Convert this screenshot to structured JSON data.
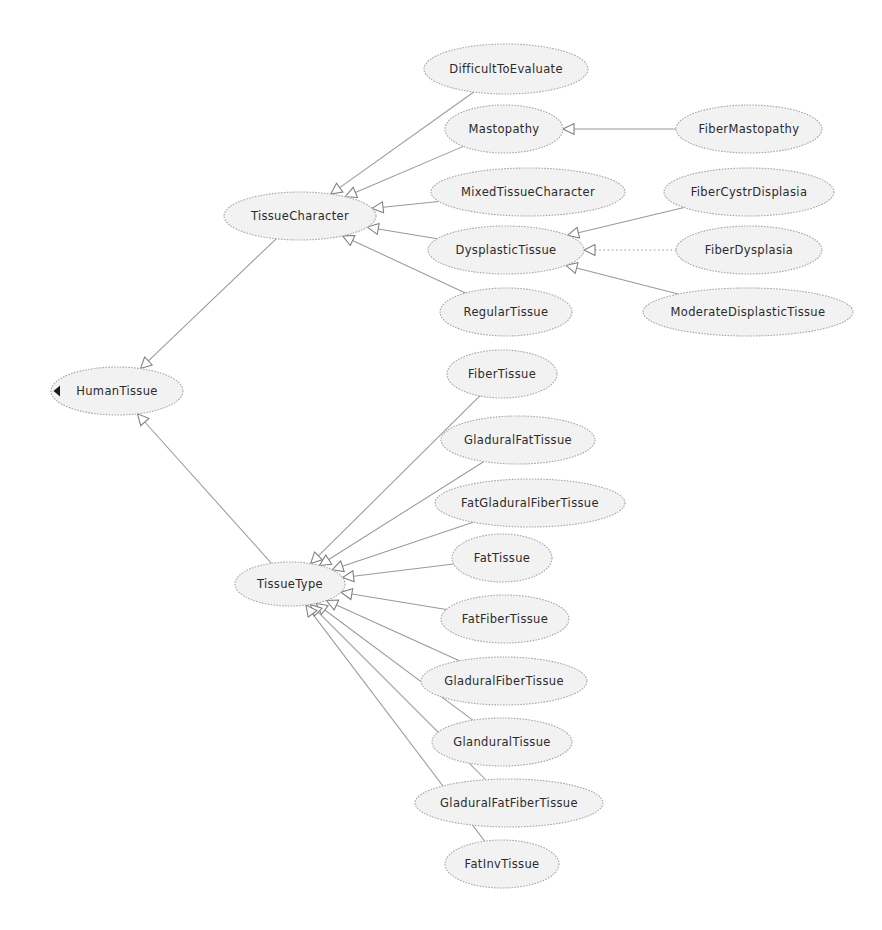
{
  "diagram": {
    "type": "uml-generalization-graph",
    "canvas": {
      "width": 882,
      "height": 930,
      "background": "#ffffff"
    },
    "style": {
      "node_fill": "#f2f2f2",
      "node_stroke": "#a8a8a8",
      "edge_stroke": "#9a9a9a",
      "label_color": "#2b2b2b",
      "root_marker_color": "#1a1a1a"
    },
    "nodes": [
      {
        "id": "DifficultToEvaluate",
        "label": "DifficultToEvaluate",
        "cx": 506,
        "cy": 69,
        "rx": 82,
        "ry": 25
      },
      {
        "id": "Mastopathy",
        "label": "Mastopathy",
        "cx": 504,
        "cy": 129,
        "rx": 59,
        "ry": 24
      },
      {
        "id": "FiberMastopathy",
        "label": "FiberMastopathy",
        "cx": 749,
        "cy": 129,
        "rx": 73,
        "ry": 24
      },
      {
        "id": "MixedTissueCharacter",
        "label": "MixedTissueCharacter",
        "cx": 528,
        "cy": 192,
        "rx": 97,
        "ry": 24
      },
      {
        "id": "FiberCystrDisplasia",
        "label": "FiberCystrDisplasia",
        "cx": 749,
        "cy": 192,
        "rx": 85,
        "ry": 24
      },
      {
        "id": "TissueCharacter",
        "label": "TissueCharacter",
        "cx": 300,
        "cy": 216,
        "rx": 76,
        "ry": 24
      },
      {
        "id": "DysplasticTissue",
        "label": "DysplasticTissue",
        "cx": 506,
        "cy": 250,
        "rx": 78,
        "ry": 24
      },
      {
        "id": "FiberDysplasia",
        "label": "FiberDysplasia",
        "cx": 749,
        "cy": 250,
        "rx": 73,
        "ry": 24
      },
      {
        "id": "RegularTissue",
        "label": "RegularTissue",
        "cx": 506,
        "cy": 312,
        "rx": 66,
        "ry": 24
      },
      {
        "id": "ModerateDisplasticTissue",
        "label": "ModerateDisplasticTissue",
        "cx": 748,
        "cy": 312,
        "rx": 105,
        "ry": 24
      },
      {
        "id": "HumanTissue",
        "label": "HumanTissue",
        "cx": 117,
        "cy": 391,
        "rx": 66,
        "ry": 24
      },
      {
        "id": "FiberTissue",
        "label": "FiberTissue",
        "cx": 502,
        "cy": 374,
        "rx": 55,
        "ry": 24
      },
      {
        "id": "GladuralFatTissue",
        "label": "GladuralFatTissue",
        "cx": 518,
        "cy": 440,
        "rx": 77,
        "ry": 24
      },
      {
        "id": "FatGladuralFiberTissue",
        "label": "FatGladuralFiberTissue",
        "cx": 530,
        "cy": 503,
        "rx": 95,
        "ry": 24
      },
      {
        "id": "FatTissue",
        "label": "FatTissue",
        "cx": 502,
        "cy": 558,
        "rx": 50,
        "ry": 24
      },
      {
        "id": "FatFiberTissue",
        "label": "FatFiberTissue",
        "cx": 505,
        "cy": 619,
        "rx": 64,
        "ry": 24
      },
      {
        "id": "GladuralFiberTissue",
        "label": "GladuralFiberTissue",
        "cx": 504,
        "cy": 681,
        "rx": 83,
        "ry": 24
      },
      {
        "id": "GlanduralTissue",
        "label": "GlanduralTissue",
        "cx": 502,
        "cy": 742,
        "rx": 70,
        "ry": 24
      },
      {
        "id": "GladuralFatFiberTissue",
        "label": "GladuralFatFiberTissue",
        "cx": 509,
        "cy": 803,
        "rx": 94,
        "ry": 24
      },
      {
        "id": "FatInvTissue",
        "label": "FatInvTissue",
        "cx": 502,
        "cy": 864,
        "rx": 57,
        "ry": 24
      }
    ],
    "edges": [
      {
        "from": "TissueCharacter",
        "to": "HumanTissue",
        "style": "solid",
        "arrow": "hollow-triangle"
      },
      {
        "from": "TissueType",
        "to": "HumanTissue",
        "style": "solid",
        "arrow": "hollow-triangle"
      },
      {
        "from": "DifficultToEvaluate",
        "to": "TissueCharacter",
        "style": "solid",
        "arrow": "hollow-triangle"
      },
      {
        "from": "Mastopathy",
        "to": "TissueCharacter",
        "style": "solid",
        "arrow": "hollow-triangle"
      },
      {
        "from": "MixedTissueCharacter",
        "to": "TissueCharacter",
        "style": "solid",
        "arrow": "hollow-triangle"
      },
      {
        "from": "DysplasticTissue",
        "to": "TissueCharacter",
        "style": "solid",
        "arrow": "hollow-triangle"
      },
      {
        "from": "RegularTissue",
        "to": "TissueCharacter",
        "style": "solid",
        "arrow": "hollow-triangle"
      },
      {
        "from": "FiberMastopathy",
        "to": "Mastopathy",
        "style": "solid",
        "arrow": "hollow-triangle"
      },
      {
        "from": "FiberCystrDisplasia",
        "to": "DysplasticTissue",
        "style": "solid",
        "arrow": "hollow-triangle"
      },
      {
        "from": "FiberDysplasia",
        "to": "DysplasticTissue",
        "style": "dotted",
        "arrow": "hollow-triangle"
      },
      {
        "from": "ModerateDisplasticTissue",
        "to": "DysplasticTissue",
        "style": "solid",
        "arrow": "hollow-triangle"
      },
      {
        "from": "FiberTissue",
        "to": "TissueType",
        "style": "solid",
        "arrow": "hollow-triangle"
      },
      {
        "from": "GladuralFatTissue",
        "to": "TissueType",
        "style": "solid",
        "arrow": "hollow-triangle"
      },
      {
        "from": "FatGladuralFiberTissue",
        "to": "TissueType",
        "style": "solid",
        "arrow": "hollow-triangle"
      },
      {
        "from": "FatTissue",
        "to": "TissueType",
        "style": "solid",
        "arrow": "hollow-triangle"
      },
      {
        "from": "FatFiberTissue",
        "to": "TissueType",
        "style": "solid",
        "arrow": "hollow-triangle"
      },
      {
        "from": "GladuralFiberTissue",
        "to": "TissueType",
        "style": "solid",
        "arrow": "hollow-triangle"
      },
      {
        "from": "GlanduralTissue",
        "to": "TissueType",
        "style": "solid",
        "arrow": "hollow-triangle"
      },
      {
        "from": "GladuralFatFiberTissue",
        "to": "TissueType",
        "style": "solid",
        "arrow": "hollow-triangle"
      },
      {
        "from": "FatInvTissue",
        "to": "TissueType",
        "style": "solid",
        "arrow": "hollow-triangle"
      }
    ],
    "labels": {
      "tissue_type_node": "TissueType",
      "human_tissue_node": "HumanTissue"
    }
  }
}
